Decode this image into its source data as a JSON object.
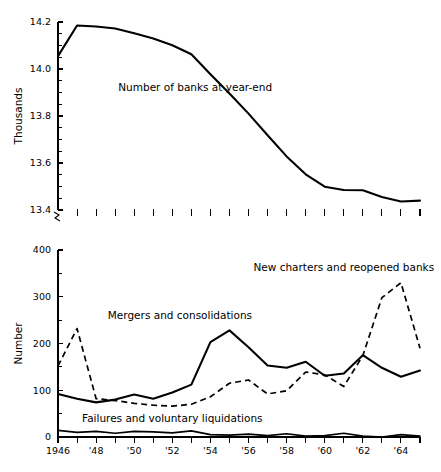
{
  "figure": {
    "background": "#ffffff",
    "line_color": "#000000"
  },
  "chart_data": [
    {
      "type": "line",
      "id": "banks-panel",
      "title": "",
      "xlabel": "",
      "ylabel": "Thousands",
      "ylim": [
        13.4,
        14.2
      ],
      "yticks": [
        13.4,
        13.6,
        13.8,
        14.0,
        14.2
      ],
      "ytick_labels": [
        "13.4",
        "13.6",
        "13.8",
        "14.0",
        "14.2"
      ],
      "yminor_step": 0.05,
      "xlim": [
        1946,
        1965
      ],
      "grid": false,
      "axis_break": true,
      "x": [
        1946,
        1947,
        1948,
        1949,
        1950,
        1951,
        1952,
        1953,
        1954,
        1955,
        1956,
        1957,
        1958,
        1959,
        1960,
        1961,
        1962,
        1963,
        1964,
        1965
      ],
      "series": [
        {
          "name": "Number of banks at year-end",
          "style": "solid",
          "label_x": 1953.2,
          "label_y": 13.905,
          "values": [
            14.055,
            14.185,
            14.181,
            14.172,
            14.152,
            14.13,
            14.101,
            14.063,
            13.978,
            13.896,
            13.81,
            13.718,
            13.628,
            13.552,
            13.499,
            13.485,
            13.484,
            13.455,
            13.436,
            13.44
          ]
        }
      ],
      "annotations": [
        {
          "text": "Number of banks at year-end",
          "x": 1953.2,
          "y": 13.905
        }
      ]
    },
    {
      "type": "line",
      "id": "bank-changes-panel",
      "title": "",
      "xlabel": "",
      "ylabel": "Number",
      "ylim": [
        0,
        400
      ],
      "yticks": [
        0,
        100,
        200,
        300,
        400
      ],
      "ytick_labels": [
        "0",
        "100",
        "200",
        "300",
        "400"
      ],
      "yminor_step": 50,
      "xlim": [
        1946,
        1965
      ],
      "grid": false,
      "x": [
        1946,
        1947,
        1948,
        1949,
        1950,
        1951,
        1952,
        1953,
        1954,
        1955,
        1956,
        1957,
        1958,
        1959,
        1960,
        1961,
        1962,
        1963,
        1964,
        1965
      ],
      "xtick_labels": [
        "1946",
        "",
        "'48",
        "",
        "'50",
        "",
        "'52",
        "",
        "'54",
        "",
        "'56",
        "",
        "'58",
        "",
        "'60",
        "",
        "'62",
        "",
        "'64",
        ""
      ],
      "series": [
        {
          "name": "New charters and reopened banks",
          "style": "dashed",
          "label_x": 1961.0,
          "label_y": 355,
          "values": [
            152,
            232,
            82,
            78,
            72,
            68,
            66,
            70,
            86,
            115,
            122,
            92,
            99,
            139,
            133,
            108,
            174,
            298,
            330,
            190
          ]
        },
        {
          "name": "Mergers and consolidations",
          "style": "solid",
          "label_x": 1952.4,
          "label_y": 252,
          "values": [
            92,
            82,
            74,
            80,
            91,
            82,
            95,
            112,
            203,
            228,
            192,
            153,
            148,
            161,
            131,
            136,
            175,
            148,
            129,
            142
          ]
        },
        {
          "name": "Failures and voluntary liquidations",
          "style": "thin",
          "label_x": 1952.0,
          "label_y": 32,
          "values": [
            14,
            10,
            12,
            8,
            12,
            11,
            9,
            13,
            5,
            4,
            6,
            3,
            7,
            2,
            3,
            8,
            2,
            0,
            5,
            2
          ]
        }
      ],
      "annotations": [
        {
          "text": "New charters and reopened banks",
          "x": 1961.0,
          "y": 355
        },
        {
          "text": "Mergers and consolidations",
          "x": 1952.4,
          "y": 252
        },
        {
          "text": "Failures and voluntary liquidations",
          "x": 1952.0,
          "y": 32
        }
      ]
    }
  ]
}
